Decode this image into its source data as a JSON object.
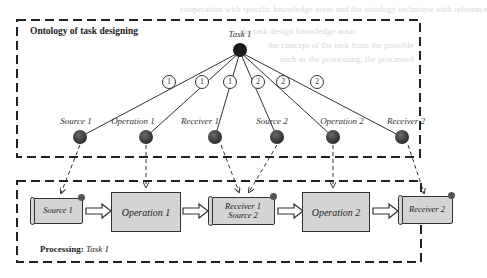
{
  "ontology": {
    "title": "Ontology of task designing",
    "root": "Task 1",
    "edge_labels": [
      "1",
      "1",
      "1",
      "2",
      "2",
      "2"
    ],
    "nodes": [
      "Source 1",
      "Operation 1",
      "Receiver 1",
      "Source 2",
      "Operation 2",
      "Receiver 2"
    ]
  },
  "processing": {
    "title_bold": "Processing:",
    "title_italic": "Task 1",
    "steps": [
      {
        "label": "Source 1",
        "kind": "scroll"
      },
      {
        "label": "Operation 1",
        "kind": "box"
      },
      {
        "label": "Receiver 1\nSource 2",
        "line1": "Receiver 1",
        "line2": "Source 2",
        "kind": "scroll"
      },
      {
        "label": "Operation 2",
        "kind": "box"
      },
      {
        "label": "Receiver 2",
        "kind": "scroll"
      }
    ]
  },
  "colors": {
    "node": "#3a3a3a",
    "box_fill": "#d4d4d4",
    "border": "#333333"
  }
}
